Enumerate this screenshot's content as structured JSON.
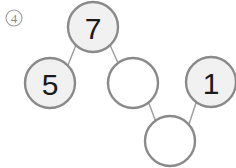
{
  "page": {
    "width": 236,
    "height": 168,
    "background_color": "#ffffff"
  },
  "index_badge": {
    "name": "item-index-badge",
    "label": "4",
    "glyph": "④",
    "center_x": 14,
    "center_y": 18,
    "radius": 8,
    "stroke_color": "#9a9a9a",
    "text_color": "#8c8c8c"
  },
  "diagram": {
    "name": "graph-diagram",
    "node_radius": 25,
    "node_stroke_color": "#8a8a8a",
    "node_stroke_width": 2.4,
    "filled_node_fill": "#f1f1f1",
    "empty_node_fill": "#ffffff",
    "edge_color": "#9b9b9b",
    "edge_width": 1.4,
    "nodes": [
      {
        "id": "n7",
        "label": "7",
        "filled": true,
        "cx": 93,
        "cy": 27
      },
      {
        "id": "n5",
        "label": "5",
        "filled": true,
        "cx": 50,
        "cy": 83
      },
      {
        "id": "nmid",
        "label": "",
        "filled": false,
        "cx": 133,
        "cy": 83
      },
      {
        "id": "n1",
        "label": "1",
        "filled": true,
        "cx": 211,
        "cy": 82
      },
      {
        "id": "nbot",
        "label": "",
        "filled": false,
        "cx": 170,
        "cy": 141
      }
    ],
    "edges": [
      {
        "from": "n5",
        "to": "n7",
        "x1": 68,
        "y1": 65,
        "x2": 76,
        "y2": 45
      },
      {
        "from": "n7",
        "to": "nmid",
        "x1": 110,
        "y1": 45,
        "x2": 118,
        "y2": 63
      },
      {
        "from": "nmid",
        "to": "nbot",
        "x1": 148,
        "y1": 101,
        "x2": 156,
        "y2": 122
      },
      {
        "from": "nbot",
        "to": "n1",
        "x1": 189,
        "y1": 124,
        "x2": 196,
        "y2": 103
      }
    ]
  }
}
